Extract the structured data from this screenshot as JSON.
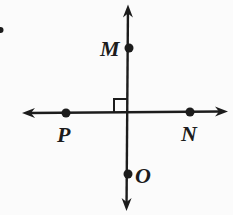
{
  "figure": {
    "background_color": "#fbfbfb",
    "ink_color": "#1c1c1c",
    "width": 233,
    "height": 215,
    "line_width": 2.4,
    "dot_radius": 4.5,
    "lines": [
      {
        "name": "horizontal-line",
        "x1": 22,
        "y1": 113,
        "x2": 228,
        "y2": 111.5,
        "arrow_start": true,
        "arrow_end": true
      },
      {
        "name": "vertical-line",
        "x1": 128,
        "y1": 4.5,
        "x2": 126.5,
        "y2": 211,
        "arrow_start": true,
        "arrow_end": true
      }
    ],
    "right_angle_marker": {
      "x": 114,
      "y": 99,
      "size": 13.4
    },
    "points": [
      {
        "label": "M",
        "dot": {
          "x": 129,
          "y": 48
        },
        "label_pos": {
          "x": 100,
          "y": 56
        }
      },
      {
        "label": "P",
        "dot": {
          "x": 66,
          "y": 113
        },
        "label_pos": {
          "x": 57,
          "y": 142
        }
      },
      {
        "label": "N",
        "dot": {
          "x": 190,
          "y": 112
        },
        "label_pos": {
          "x": 181,
          "y": 141
        }
      },
      {
        "label": "O",
        "dot": {
          "x": 128,
          "y": 174
        },
        "label_pos": {
          "x": 135,
          "y": 183
        }
      }
    ],
    "stray_mark": {
      "x": 0.5,
      "y": 30,
      "r": 3
    }
  }
}
